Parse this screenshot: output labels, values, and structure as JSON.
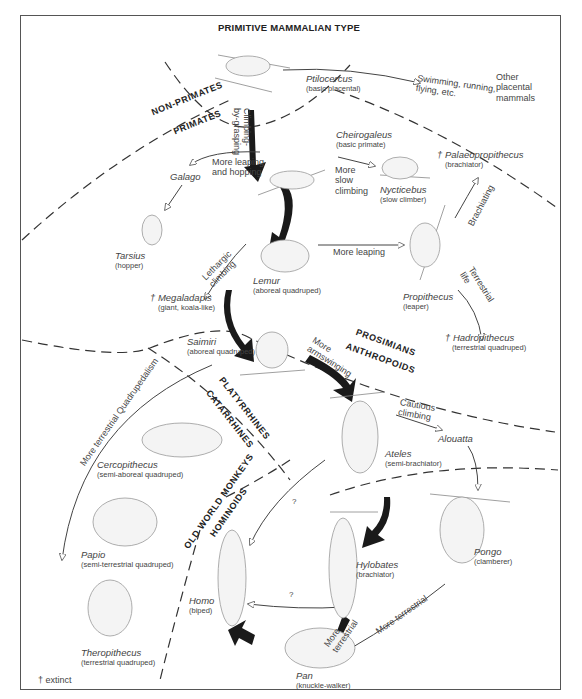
{
  "title": "PRIMITIVE MAMMALIAN TYPE",
  "footnote": "† extinct",
  "groups": {
    "non_primates": "NON-PRIMATES",
    "primates": "PRIMATES",
    "prosimians": "PROSIMIANS",
    "anthropoids": "ANTHROPOIDS",
    "platyrrhines": "PLATYRRHINES",
    "catarrhines": "CATARRHINES",
    "old_world_monkeys": "OLD WORLD MONKEYS",
    "hominoids": "HOMINOIDS"
  },
  "taxa": {
    "ptilocercus": {
      "name": "Ptilocercus",
      "desc": "(basic placental)"
    },
    "other": {
      "line1": "Other",
      "line2": "placental",
      "line3": "mammals"
    },
    "cheirogaleus": {
      "name": "Cheirogaleus",
      "desc": "(basic primate)"
    },
    "galago": {
      "name": "Galago"
    },
    "nycticebus": {
      "name": "Nycticebus",
      "desc": "(slow climber)"
    },
    "palaeopropithecus": {
      "name": "† Palaeopropithecus",
      "desc": "(brachiator)"
    },
    "tarsius": {
      "name": "Tarsius",
      "desc": "(hopper)"
    },
    "lemur": {
      "name": "Lemur",
      "desc": "(aboreal quadruped)"
    },
    "propithecus": {
      "name": "Propithecus",
      "desc": "(leaper)"
    },
    "megaladapis": {
      "name": "† Megaladapis",
      "desc": "(giant, koala-like)"
    },
    "hadropithecus": {
      "name": "† Hadropithecus",
      "desc": "(terrestrial quadruped)"
    },
    "saimiri": {
      "name": "Saimiri",
      "desc": "(aboreal quadruped)"
    },
    "ateles": {
      "name": "Ateles",
      "desc": "(semi-brachiator)"
    },
    "alouatta": {
      "name": "Alouatta"
    },
    "cercopithecus": {
      "name": "Cercopithecus",
      "desc": "(semi-aboreal quadruped)"
    },
    "papio": {
      "name": "Papio",
      "desc": "(semi-terrestrial quadruped)"
    },
    "theropithecus": {
      "name": "Theropithecus",
      "desc": "(terrestrial quadruped)"
    },
    "homo": {
      "name": "Homo",
      "desc": "(biped)"
    },
    "hylobates": {
      "name": "Hylobates",
      "desc": "(brachiator)"
    },
    "pongo": {
      "name": "Pongo",
      "desc": "(clamberer)"
    },
    "pan": {
      "name": "Pan",
      "desc": "(knuckle-walker)"
    }
  },
  "transitions": {
    "swimming": {
      "line1": "Swimming, running,",
      "line2": "flying, etc."
    },
    "climbing": {
      "line1": "Climbing-",
      "line2": "by-grasping"
    },
    "leaping_hopping": {
      "line1": "More leaping",
      "line2": "and hopping"
    },
    "slow_climbing": {
      "line1": "More",
      "line2": "slow",
      "line3": "climbing"
    },
    "more_leaping": "More leaping",
    "brachiating": "Brachiating",
    "lethargic": {
      "line1": "Lethargic",
      "line2": "climbing"
    },
    "terrestrial_life": {
      "line1": "Terrestrial",
      "line2": "life"
    },
    "armswinging": {
      "line1": "More",
      "line2": "armswinging"
    },
    "cautious": {
      "line1": "Cautious",
      "line2": "climbing"
    },
    "quadrupedalism": "More terrestrial Quadrupedalism",
    "q1": "?",
    "q2": "?",
    "more_terrestrial_pan": {
      "line1": "More",
      "line2": "terrestrial"
    },
    "more_terrestrial_pongo": "More terrestrial"
  },
  "caption": "Figure 5.3  Major locomotor adaptations..."
}
